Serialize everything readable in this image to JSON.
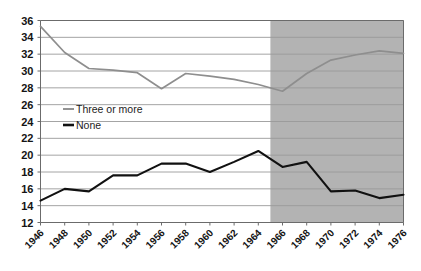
{
  "chart_data": {
    "type": "line",
    "title": "",
    "subtitle": "",
    "xlabel": "",
    "ylabel": "",
    "x": [
      1946,
      1948,
      1950,
      1952,
      1954,
      1956,
      1958,
      1960,
      1962,
      1964,
      1966,
      1968,
      1970,
      1972,
      1974,
      1976
    ],
    "xtick_labels": [
      "1946",
      "1948",
      "1950",
      "1952",
      "1954",
      "1956",
      "1958",
      "1960",
      "1962",
      "1964",
      "1966",
      "1968",
      "1970",
      "1972",
      "1974",
      "1976"
    ],
    "ytick_labels": [
      "12",
      "14",
      "16",
      "18",
      "20",
      "22",
      "24",
      "26",
      "28",
      "30",
      "32",
      "34",
      "36"
    ],
    "yticks": [
      12,
      14,
      16,
      18,
      20,
      22,
      24,
      26,
      28,
      30,
      32,
      34,
      36
    ],
    "ylim": [
      12,
      36
    ],
    "xlim": [
      1946,
      1976
    ],
    "grid": "horizontal",
    "legend_position": "inside-left",
    "series": [
      {
        "name": "Three or more",
        "color": "#8e8e8e",
        "values": [
          35.3,
          32.2,
          30.3,
          30.1,
          29.8,
          27.9,
          29.7,
          29.4,
          29.0,
          28.4,
          27.6,
          29.7,
          31.3,
          31.9,
          32.4,
          32.1
        ]
      },
      {
        "name": "None",
        "color": "#111111",
        "values": [
          14.6,
          16.0,
          15.7,
          17.6,
          17.6,
          19.0,
          19.0,
          18.0,
          19.2,
          20.5,
          18.6,
          19.2,
          15.7,
          15.8,
          14.9,
          15.3
        ]
      }
    ],
    "shaded_region": {
      "x_start": 1965,
      "x_end": 1976,
      "color": "#b3b3b3"
    },
    "axis_color": "#6b6b6b",
    "gridline_color": "#9a9a9a",
    "background": "#ffffff"
  }
}
